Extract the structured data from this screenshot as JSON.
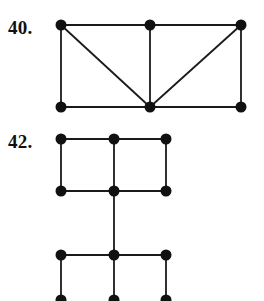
{
  "page": {
    "background_color": "#ffffff",
    "ink_color": "#111111",
    "width": 264,
    "height": 301
  },
  "problems": [
    {
      "id": "problem-40",
      "label": "40.",
      "label_x": 8,
      "label_y": 18,
      "graph": {
        "type": "graph-diagram",
        "vertex_radius": 5.5,
        "edge_width": 1.8,
        "vertices": [
          {
            "name": "top-left",
            "x": 61,
            "y": 25
          },
          {
            "name": "top-middle",
            "x": 150,
            "y": 25
          },
          {
            "name": "top-right",
            "x": 241,
            "y": 25
          },
          {
            "name": "bottom-left",
            "x": 61,
            "y": 107
          },
          {
            "name": "bottom-middle",
            "x": 150,
            "y": 107
          },
          {
            "name": "bottom-right",
            "x": 241,
            "y": 107
          }
        ],
        "edges": [
          {
            "name": "edge-top-left-top-middle",
            "from": 0,
            "to": 1
          },
          {
            "name": "edge-top-middle-top-right",
            "from": 1,
            "to": 2
          },
          {
            "name": "edge-top-left-bottom-left",
            "from": 0,
            "to": 3
          },
          {
            "name": "edge-top-right-bottom-right",
            "from": 2,
            "to": 5
          },
          {
            "name": "edge-bottom-left-bottom-middle",
            "from": 3,
            "to": 4
          },
          {
            "name": "edge-bottom-middle-bottom-right",
            "from": 4,
            "to": 5
          },
          {
            "name": "edge-top-middle-bottom-middle",
            "from": 1,
            "to": 4
          },
          {
            "name": "edge-diagonal-top-left-bottom-mid",
            "from": 0,
            "to": 4
          },
          {
            "name": "edge-diagonal-bottom-mid-top-right",
            "from": 4,
            "to": 2
          }
        ]
      }
    },
    {
      "id": "problem-42",
      "label": "42.",
      "label_x": 8,
      "label_y": 132,
      "graph": {
        "type": "graph-diagram",
        "vertex_radius": 5.5,
        "edge_width": 1.8,
        "clipped_at_bottom": true,
        "vertices": [
          {
            "name": "r1c1",
            "x": 61,
            "y": 139
          },
          {
            "name": "r1c2",
            "x": 114,
            "y": 139
          },
          {
            "name": "r1c3",
            "x": 166,
            "y": 139
          },
          {
            "name": "r2c1",
            "x": 61,
            "y": 191
          },
          {
            "name": "r2c2",
            "x": 114,
            "y": 191
          },
          {
            "name": "r2c3",
            "x": 166,
            "y": 191
          },
          {
            "name": "r3c1",
            "x": 61,
            "y": 255
          },
          {
            "name": "r3c2",
            "x": 114,
            "y": 255
          },
          {
            "name": "r3c3",
            "x": 166,
            "y": 255
          },
          {
            "name": "r4c1",
            "x": 61,
            "y": 300
          },
          {
            "name": "r4c2",
            "x": 114,
            "y": 300
          },
          {
            "name": "r4c3",
            "x": 166,
            "y": 300
          }
        ],
        "edges": [
          {
            "name": "edge-r1c1-r1c2",
            "from": 0,
            "to": 1
          },
          {
            "name": "edge-r1c2-r1c3",
            "from": 1,
            "to": 2
          },
          {
            "name": "edge-r1c1-r2c1",
            "from": 0,
            "to": 3
          },
          {
            "name": "edge-r1c2-r2c2",
            "from": 1,
            "to": 4
          },
          {
            "name": "edge-r1c3-r2c3",
            "from": 2,
            "to": 5
          },
          {
            "name": "edge-r2c1-r2c2",
            "from": 3,
            "to": 4
          },
          {
            "name": "edge-r2c2-r2c3",
            "from": 4,
            "to": 5
          },
          {
            "name": "edge-r2c2-r3c2",
            "from": 4,
            "to": 7
          },
          {
            "name": "edge-r3c1-r3c2",
            "from": 6,
            "to": 7
          },
          {
            "name": "edge-r3c2-r3c3",
            "from": 7,
            "to": 8
          },
          {
            "name": "edge-r3c1-r4c1",
            "from": 6,
            "to": 9
          },
          {
            "name": "edge-r3c2-r4c2",
            "from": 7,
            "to": 10
          },
          {
            "name": "edge-r3c3-r4c3",
            "from": 8,
            "to": 11
          }
        ]
      }
    }
  ]
}
